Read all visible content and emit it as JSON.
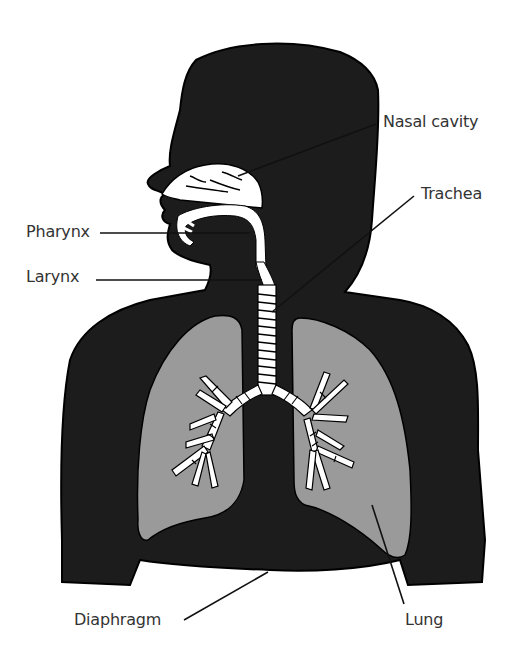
{
  "diagram": {
    "colors": {
      "body": "#1c1c1c",
      "lung": "#9a9a9a",
      "airway": "#ffffff",
      "leader_line": "#111111",
      "label_text": "#333333",
      "background": "#ffffff"
    },
    "labels": [
      {
        "id": "nasal-cavity",
        "text": "Nasal cavity"
      },
      {
        "id": "trachea",
        "text": "Trachea"
      },
      {
        "id": "pharynx",
        "text": "Pharynx"
      },
      {
        "id": "larynx",
        "text": "Larynx"
      },
      {
        "id": "diaphragm",
        "text": "Diaphragm"
      },
      {
        "id": "lung",
        "text": "Lung"
      }
    ]
  }
}
